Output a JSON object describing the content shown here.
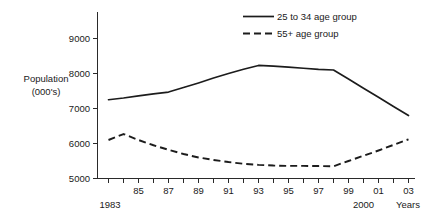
{
  "chart_data": {
    "type": "line",
    "title": "",
    "xlabel": "Years",
    "ylabel": "Population (000's)",
    "ylabel_line1": "Population",
    "ylabel_line2": "(000's)",
    "xlim": [
      1983,
      2003
    ],
    "ylim": [
      5000,
      9000
    ],
    "grid": false,
    "legend_position": "top-right",
    "y_ticks": [
      "5000",
      "6000",
      "7000",
      "8000",
      "9000"
    ],
    "y_tick_values": [
      5000,
      6000,
      7000,
      8000,
      9000
    ],
    "x_tick_labels": [
      "1983",
      "85",
      "87",
      "89",
      "91",
      "93",
      "95",
      "97",
      "99",
      "01",
      "03"
    ],
    "x_tick_values": [
      1983,
      1985,
      1987,
      1989,
      1991,
      1993,
      1995,
      1997,
      1999,
      2001,
      2003
    ],
    "x_annotation_2000": "2000",
    "x_annotation_2000_value": 2000,
    "x": [
      1983,
      1984,
      1985,
      1986,
      1987,
      1988,
      1989,
      1990,
      1991,
      1992,
      1993,
      1994,
      1995,
      1996,
      1997,
      1998,
      1999,
      2000,
      2001,
      2002,
      2003
    ],
    "series": [
      {
        "name": "25 to 34 age group",
        "style": "solid",
        "values": [
          7250,
          7300,
          7360,
          7420,
          7470,
          7600,
          7730,
          7870,
          8000,
          8120,
          8230,
          8210,
          8180,
          8150,
          8120,
          8100,
          7840,
          7580,
          7320,
          7060,
          6800
        ]
      },
      {
        "name": "55+ age group",
        "style": "dashed",
        "values": [
          6100,
          6270,
          6100,
          5950,
          5820,
          5700,
          5600,
          5530,
          5470,
          5420,
          5390,
          5370,
          5360,
          5360,
          5355,
          5350,
          5500,
          5650,
          5800,
          5960,
          6120
        ]
      }
    ],
    "legend": [
      {
        "label": "25 to 34 age group",
        "style": "solid"
      },
      {
        "label": "55+ age group",
        "style": "dashed"
      }
    ],
    "colors": {
      "line": "#1c1c1c",
      "axis": "#2a2a2a",
      "background": "#ffffff",
      "text": "#1a1a1a"
    }
  }
}
